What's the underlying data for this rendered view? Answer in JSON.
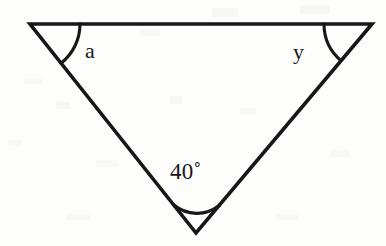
{
  "figure": {
    "kind": "geometry-diagram",
    "shape": "triangle",
    "orientation": "inverted",
    "background_color": "#fdfdfc",
    "stroke_color": "#17171a",
    "stroke_width_px": 3.6
  },
  "labels": {
    "left_angle": "a",
    "right_angle": "y",
    "bottom_angle": "40˚"
  },
  "chart_data": {
    "type": "diagram",
    "title": "",
    "vertices": [
      {
        "name": "left-vertex",
        "x": 30,
        "y": 24
      },
      {
        "name": "right-vertex",
        "x": 372,
        "y": 24
      },
      {
        "name": "bottom-vertex",
        "x": 196,
        "y": 233
      }
    ],
    "edges": [
      {
        "name": "top-edge",
        "from": "left-vertex",
        "to": "right-vertex"
      },
      {
        "name": "left-edge",
        "from": "left-vertex",
        "to": "bottom-vertex"
      },
      {
        "name": "right-edge",
        "from": "right-vertex",
        "to": "bottom-vertex"
      }
    ],
    "angles": [
      {
        "name": "left-angle",
        "label": "a",
        "vertex": "left-vertex",
        "arc_radius": 50,
        "value": null
      },
      {
        "name": "right-angle",
        "label": "y",
        "vertex": "right-vertex",
        "arc_radius": 48,
        "value": null
      },
      {
        "name": "bottom-angle",
        "label": "40˚",
        "vertex": "bottom-vertex",
        "arc_radius": 36,
        "value": 40,
        "unit": "degrees"
      }
    ]
  }
}
